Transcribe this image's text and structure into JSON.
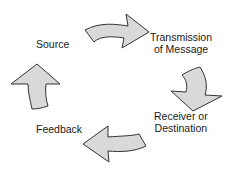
{
  "diagram": {
    "type": "cycle",
    "nodes": [
      {
        "id": "source",
        "label_line1": "Source",
        "label_line2": ""
      },
      {
        "id": "transmission",
        "label_line1": "Transmission",
        "label_line2": "of Message"
      },
      {
        "id": "receiver",
        "label_line1": "Receiver or",
        "label_line2": "Destination"
      },
      {
        "id": "feedback",
        "label_line1": "Feedback",
        "label_line2": ""
      }
    ],
    "edges": [
      {
        "from": "source",
        "to": "transmission"
      },
      {
        "from": "transmission",
        "to": "receiver"
      },
      {
        "from": "receiver",
        "to": "feedback"
      },
      {
        "from": "feedback",
        "to": "source"
      }
    ],
    "colors": {
      "arrow_fill": "#d9d9d9",
      "arrow_stroke": "#333333",
      "text": "#1a1a1a",
      "background": "#ffffff"
    }
  }
}
